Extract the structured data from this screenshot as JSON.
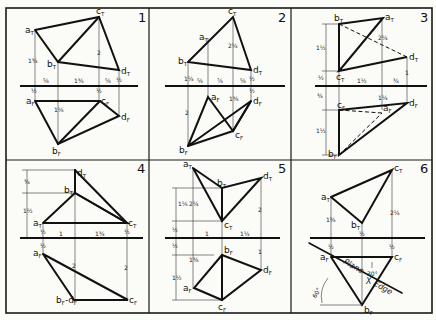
{
  "panels": [
    {
      "number": "1",
      "top_view": [
        "aT",
        "bT",
        "cT",
        "dT"
      ],
      "front_view": [
        "aF",
        "bF",
        "cF",
        "dF"
      ],
      "dimensions": [
        "1 3/4",
        "5/8",
        "1 3/8",
        "5/8",
        "2",
        "1/2",
        "1/2",
        "1/2",
        "1 1/8"
      ]
    },
    {
      "number": "2",
      "top_view": [
        "aT",
        "bT",
        "cT",
        "dT"
      ],
      "front_view": [
        "aF",
        "bF",
        "cF",
        "dF"
      ],
      "dimensions": [
        "2 1/4",
        "1 1/4",
        "5/8",
        "7/8",
        "5/8",
        "1/2",
        "1 3/8",
        "1 1/2",
        "1/2",
        "2"
      ]
    },
    {
      "number": "3",
      "top_view": [
        "aT",
        "bT",
        "cT",
        "dT"
      ],
      "front_view": [
        "aF",
        "bF",
        "cF",
        "dF"
      ],
      "dimensions": [
        "1 1/2",
        "1/2",
        "2 1/4",
        "1",
        "1 1/2",
        "3/4",
        "1/2",
        "3/4",
        "1 1/4",
        "1 1/2"
      ]
    },
    {
      "number": "4",
      "top_view": [
        "aT",
        "bT",
        "cT",
        "dT"
      ],
      "front_view": [
        "aF",
        "bF-dF",
        "cF"
      ],
      "dimensions": [
        "3/4",
        "1 1/2",
        "1/2",
        "1",
        "1 3/4",
        "1/2",
        "1/2",
        "2",
        "2"
      ]
    },
    {
      "number": "5",
      "top_view": [
        "aT",
        "bT",
        "cT",
        "dT"
      ],
      "front_view": [
        "aF",
        "bF",
        "cF",
        "dF"
      ],
      "dimensions": [
        "1 1/8",
        "2 1/4",
        "1/2",
        "1",
        "1 1/4",
        "2",
        "1/2",
        "1 1/2",
        "1 3/8",
        "1"
      ]
    },
    {
      "number": "6",
      "top_view": [
        "aT",
        "bT",
        "cT"
      ],
      "front_view": [
        "aF",
        "bF",
        "cF"
      ],
      "dimensions": [
        "1 3/8",
        "2 1/4",
        "1/2",
        "1/2",
        "1/2",
        "30°",
        "60°"
      ],
      "annotations": {
        "plane": "Plane",
        "x": "X",
        "edge": "Edge"
      }
    }
  ],
  "labels": {
    "aT": "a",
    "bT": "b",
    "cT": "c",
    "dT": "d",
    "aF": "a",
    "bF": "b",
    "cF": "c",
    "dF": "d",
    "subT": "T",
    "subF": "F",
    "bFdF": "b",
    "d_joined": "d"
  },
  "dim_text": {
    "p1_a": "1¾",
    "p1_h1": "⅝",
    "p1_h2": "1⅜",
    "p1_h3": "⅝",
    "p1_c": "2",
    "p1_d": "½",
    "p1_l1": "½",
    "p1_l2": "½",
    "p1_b": "1⅛",
    "p2_c": "2¼",
    "p2_a": "1¼",
    "p2_b": "2",
    "p2_h1": "⅝",
    "p2_h2": "⅞",
    "p2_h3": "⅝",
    "p2_d": "½",
    "p2_dF": "½",
    "p2_cF": "1⅜",
    "p3_v1": "1½",
    "p3_v2": "½",
    "p3_a": "2¼",
    "p3_d": "1",
    "p3_h1": "1½",
    "p3_h2": "¾",
    "p3_v3": "¾",
    "p3_v4": "1½",
    "p3_aF": "1¼",
    "p4_v1": "¾",
    "p4_v2": "1½",
    "p4_h1": "1",
    "p4_h2": "1¾",
    "p4_a": "½",
    "p4_c": "½",
    "p4_aF": "½",
    "p4_b": "2",
    "p4_cF": "2",
    "p5_v1": "1⅛",
    "p5_a": "2¼",
    "p5_v2": "½",
    "p5_h1": "1",
    "p5_h2": "1¼",
    "p5_d": "2",
    "p5_v3": "½",
    "p5_v4": "1½",
    "p5_aF": "1⅜",
    "p5_dF": "1",
    "p6_a": "1⅜",
    "p6_c": "2¼",
    "p6_b": "½",
    "p6_aF": "½",
    "p6_cF": "½",
    "p6_ang1": "30°",
    "p6_ang2": "60°",
    "p6_plane": "Plane",
    "p6_x": "X",
    "p6_edge": "Edge"
  }
}
